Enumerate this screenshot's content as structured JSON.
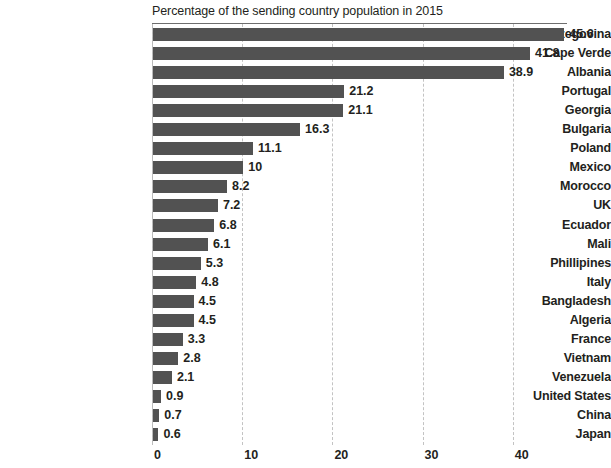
{
  "title_remnant": "",
  "subtitle": "Percentage of the sending country population in 2015",
  "axis": {
    "ticks": [
      "0",
      "10",
      "20",
      "30",
      "40"
    ]
  },
  "chart_data": {
    "type": "bar",
    "orientation": "horizontal",
    "title": "",
    "subtitle": "Percentage of the sending country population in 2015",
    "xlabel": "",
    "ylabel": "",
    "xlim": [
      0,
      46
    ],
    "xticks": [
      0,
      10,
      20,
      30,
      40
    ],
    "grid": "vertical-dashed",
    "legend": "none",
    "bar_color": "#525252",
    "categories": [
      "Bosnia and Herzegovina",
      "Cape Verde",
      "Albania",
      "Portugal",
      "Georgia",
      "Bulgaria",
      "Poland",
      "Mexico",
      "Morocco",
      "UK",
      "Ecuador",
      "Mali",
      "Phillipines",
      "Italy",
      "Bangladesh",
      "Algeria",
      "France",
      "Vietnam",
      "Venezuela",
      "United States",
      "China",
      "Japan"
    ],
    "values": [
      45.6,
      41.8,
      38.9,
      21.2,
      21.1,
      16.3,
      11.1,
      10,
      8.2,
      7.2,
      6.8,
      6.1,
      5.3,
      4.8,
      4.5,
      4.5,
      3.3,
      2.8,
      2.1,
      0.9,
      0.7,
      0.6
    ],
    "value_labels": [
      "45.6",
      "41.8",
      "38.9",
      "21.2",
      "21.1",
      "16.3",
      "11.1",
      "10",
      "8.2",
      "7.2",
      "6.8",
      "6.1",
      "5.3",
      "4.8",
      "4.5",
      "4.5",
      "3.3",
      "2.8",
      "2.1",
      "0.9",
      "0.7",
      "0.6"
    ]
  }
}
